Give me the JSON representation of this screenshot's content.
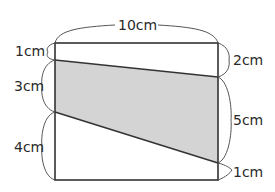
{
  "figure": {
    "type": "rectangle-with-shaded-trapezoid",
    "colors": {
      "shade": "#d4d4d4",
      "edge": "#333333",
      "text": "#2a2a2a"
    },
    "labels": {
      "top_width": "10cm",
      "left_top": "1cm",
      "left_middle": "3cm",
      "left_bottom": "4cm",
      "right_top": "2cm",
      "right_middle": "5cm",
      "right_bottom": "1cm"
    }
  }
}
